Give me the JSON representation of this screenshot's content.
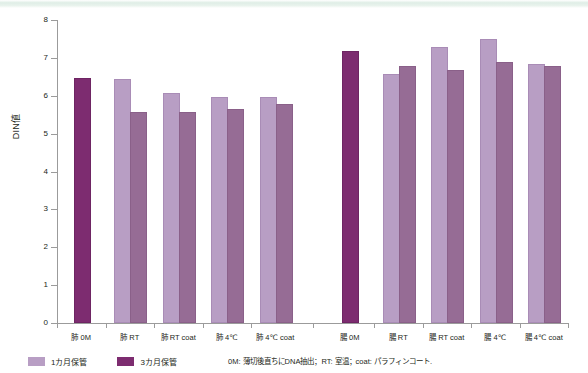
{
  "chart_data": {
    "type": "bar",
    "title": "",
    "xlabel": "",
    "ylabel": "DIN値",
    "ylim": [
      0,
      8
    ],
    "yticks": [
      0,
      1,
      2,
      3,
      4,
      5,
      6,
      7,
      8
    ],
    "grid": false,
    "legend_position": "bottom-left",
    "categories": [
      "肺 0M",
      "肺 RT",
      "肺 RT coat",
      "肺 4℃",
      "肺 4℃ coat",
      "腸 0M",
      "腸 RT",
      "腸 RT coat",
      "腸 4℃",
      "腸 4℃ coat"
    ],
    "series": [
      {
        "name": "1カ月保管",
        "color": "#b89ec4",
        "values": [
          null,
          6.4,
          6.02,
          5.92,
          5.92,
          null,
          6.52,
          7.23,
          7.44,
          6.78
        ]
      },
      {
        "name": "3カ月保管",
        "color": "#7d2c70",
        "values": [
          6.42,
          5.51,
          5.52,
          5.61,
          5.73,
          7.14,
          6.73,
          6.64,
          6.83,
          6.72
        ]
      }
    ],
    "baseline_bars": [
      {
        "category": "肺 0M",
        "value": 6.42,
        "color": "#7d2c70"
      },
      {
        "category": "腸 0M",
        "value": 7.14,
        "color": "#7d2c70"
      }
    ],
    "annotation": "0M: 薄切後直ちにDNA抽出；RT: 室温；coat: パラフィンコート."
  },
  "axis": {
    "y_title": "DIN値",
    "y_tick_labels": [
      "8",
      "7",
      "6",
      "5",
      "4",
      "3",
      "2",
      "1",
      "0"
    ]
  },
  "legend": {
    "items": [
      {
        "label": "1カ月保管",
        "swatch": "light"
      },
      {
        "label": "3カ月保管",
        "swatch": "dark"
      }
    ]
  },
  "footnote": {
    "text": "0M: 薄切後直ちにDNA抽出；RT: 室温；coat: パラフィンコート."
  },
  "x_labels": [
    "肺 0M",
    "肺 RT",
    "肺 RT coat",
    "肺 4℃",
    "肺 4℃ coat",
    "腸 0M",
    "腸 RT",
    "腸 RT coat",
    "腸 4℃",
    "腸 4℃ coat"
  ]
}
